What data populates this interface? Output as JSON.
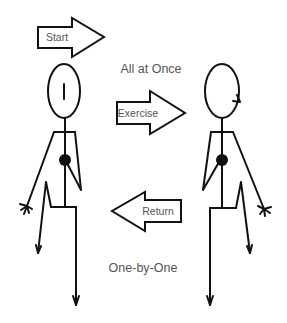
{
  "diagram": {
    "arrows": {
      "start": {
        "label": "Start",
        "direction": "right"
      },
      "exercise": {
        "label": "Exercise",
        "direction": "right"
      },
      "return": {
        "label": "Return",
        "direction": "left"
      }
    },
    "captions": {
      "top": "All at Once",
      "bottom": "One-by-One"
    },
    "figures": [
      {
        "id": "left-figure",
        "head_mark": "vertical-line",
        "facing": "front"
      },
      {
        "id": "right-figure",
        "head_mark": "side-notch",
        "facing": "side"
      }
    ],
    "colors": {
      "stroke": "#111111",
      "text": "#555555",
      "background": "#ffffff"
    }
  }
}
